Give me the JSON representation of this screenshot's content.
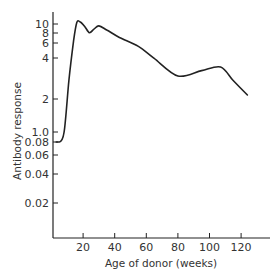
{
  "chart_data": {
    "type": "line",
    "title": "",
    "xlabel": "Age of donor (weeks)",
    "ylabel": "Antibody response",
    "xlim": [
      0,
      135
    ],
    "x_ticks": [
      20,
      40,
      60,
      80,
      100,
      120
    ],
    "y_ticks": [
      "10",
      "8",
      "6",
      "4",
      "2",
      "1.0",
      "0.08",
      "0.06",
      "0.04",
      "0.02"
    ],
    "y_scale": "log (with axis break between 0.08 and 1.0)",
    "grid": false,
    "legend": null,
    "series": [
      {
        "name": "Antibody response",
        "x": [
          3,
          5,
          8,
          11,
          14,
          16,
          18,
          21,
          24,
          27,
          30,
          35,
          43,
          55,
          65,
          80,
          95,
          107,
          115,
          124
        ],
        "values": [
          0.08,
          0.08,
          1.0,
          3.0,
          7.0,
          10.3,
          10.5,
          9.5,
          8.3,
          9.0,
          9.6,
          8.8,
          7.5,
          6.2,
          4.8,
          3.3,
          3.7,
          4.0,
          3.0,
          2.2
        ]
      }
    ]
  },
  "axes": {
    "x_tick_labels": [
      "20",
      "40",
      "60",
      "80",
      "100",
      "120"
    ],
    "y_tick_labels": [
      "10",
      "8",
      "6",
      "4",
      "2",
      "1.0",
      "0.08",
      "0.06",
      "0.04",
      "0.02"
    ],
    "x_title": "Age of donor (weeks)",
    "y_title": "Antibody response"
  }
}
